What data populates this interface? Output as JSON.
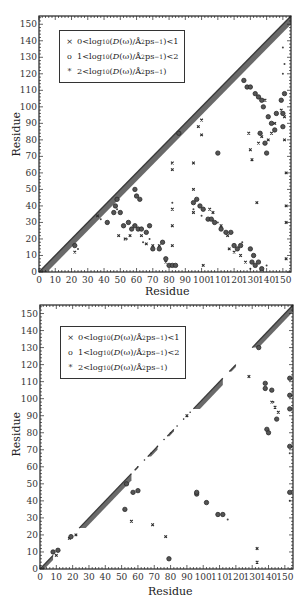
{
  "chart_data": [
    {
      "type": "scatter",
      "panel": "top",
      "title": "",
      "xlabel": "Residue",
      "ylabel": "Residue",
      "xlim": [
        0,
        155
      ],
      "ylim": [
        0,
        155
      ],
      "x_ticks": [
        0,
        10,
        20,
        30,
        40,
        50,
        60,
        70,
        80,
        90,
        100,
        110,
        120,
        130,
        140,
        150
      ],
      "y_ticks": [
        0,
        10,
        20,
        30,
        40,
        50,
        60,
        70,
        80,
        90,
        100,
        110,
        120,
        130,
        140,
        150
      ],
      "grid": false,
      "legend_position": "upper-left inside",
      "legend": [
        {
          "symbol": "x-small",
          "label": "0 < log10 (D(ω)/Å²ps⁻¹) < 1"
        },
        {
          "symbol": "circle",
          "label": "1 < log10 (D(ω)/Å²ps⁻¹) < 2"
        },
        {
          "symbol": "asterisk",
          "label": "2 < log10 (D(ω)/Å²ps⁻¹)"
        }
      ],
      "diagonal_band": {
        "from": 0,
        "to": 155,
        "width_residues": 5,
        "description": "dense band along the diagonal i≈j (all classes)"
      },
      "series": [
        {
          "name": "0 < log10 D < 1",
          "marker": "x",
          "points": [
            [
              22,
              12
            ],
            [
              36,
              34
            ],
            [
              49,
              22
            ],
            [
              53,
              20
            ],
            [
              56,
              22
            ],
            [
              63,
              22
            ],
            [
              66,
              17
            ],
            [
              70,
              16
            ],
            [
              74,
              16
            ],
            [
              78,
              6
            ],
            [
              82,
              62
            ],
            [
              82,
              66
            ],
            [
              82,
              38
            ],
            [
              82,
              28
            ],
            [
              82,
              16
            ],
            [
              95,
              66
            ],
            [
              95,
              50
            ],
            [
              95,
              42
            ],
            [
              95,
              36
            ],
            [
              98,
              88
            ],
            [
              100,
              92
            ],
            [
              100,
              83
            ],
            [
              101,
              4
            ],
            [
              105,
              38
            ],
            [
              107,
              36
            ],
            [
              112,
              28
            ],
            [
              116,
              22
            ],
            [
              117,
              14
            ],
            [
              120,
              12
            ],
            [
              124,
              10
            ],
            [
              127,
              6
            ],
            [
              129,
              84
            ],
            [
              130,
              74
            ],
            [
              131,
              68
            ],
            [
              134,
              42
            ],
            [
              135,
              78
            ],
            [
              137,
              82
            ],
            [
              139,
              104
            ],
            [
              141,
              80
            ],
            [
              143,
              84
            ],
            [
              145,
              90
            ],
            [
              149,
              98
            ],
            [
              151,
              94
            ],
            [
              151,
              80
            ],
            [
              152,
              60
            ],
            [
              152,
              40
            ],
            [
              152,
              30
            ],
            [
              152,
              8
            ]
          ]
        },
        {
          "name": "1 < log10 D < 2",
          "marker": "circle",
          "points": [
            [
              22,
              16
            ],
            [
              42,
              30
            ],
            [
              46,
              36
            ],
            [
              47,
              40
            ],
            [
              48,
              44
            ],
            [
              50,
              36
            ],
            [
              52,
              28
            ],
            [
              55,
              30
            ],
            [
              57,
              26
            ],
            [
              59,
              28
            ],
            [
              61,
              26
            ],
            [
              62,
              44
            ],
            [
              59,
              50
            ],
            [
              60,
              46
            ],
            [
              63,
              26
            ],
            [
              66,
              24
            ],
            [
              68,
              28
            ],
            [
              70,
              14
            ],
            [
              74,
              14
            ],
            [
              76,
              18
            ],
            [
              78,
              8
            ],
            [
              80,
              4
            ],
            [
              82,
              4
            ],
            [
              84,
              4
            ],
            [
              86,
              84
            ],
            [
              95,
              42
            ],
            [
              97,
              44
            ],
            [
              99,
              40
            ],
            [
              101,
              38
            ],
            [
              104,
              32
            ],
            [
              106,
              32
            ],
            [
              108,
              30
            ],
            [
              110,
              72
            ],
            [
              112,
              26
            ],
            [
              115,
              24
            ],
            [
              118,
              24
            ],
            [
              120,
              16
            ],
            [
              122,
              14
            ],
            [
              124,
              16
            ],
            [
              126,
              116
            ],
            [
              128,
              112
            ],
            [
              130,
              112
            ],
            [
              130,
              14
            ],
            [
              132,
              10
            ],
            [
              133,
              108
            ],
            [
              135,
              106
            ],
            [
              136,
              84
            ],
            [
              137,
              104
            ],
            [
              138,
              100
            ],
            [
              139,
              78
            ],
            [
              140,
              72
            ],
            [
              141,
              94
            ],
            [
              143,
              90
            ],
            [
              145,
              86
            ],
            [
              146,
              96
            ],
            [
              149,
              104
            ],
            [
              150,
              96
            ],
            [
              150,
              88
            ],
            [
              151,
              108
            ],
            [
              131,
              6
            ],
            [
              133,
              4
            ],
            [
              135,
              6
            ],
            [
              137,
              2
            ]
          ]
        },
        {
          "name": "2 < log10 D",
          "marker": "asterisk",
          "points": [
            [
              24,
              14
            ],
            [
              38,
              32
            ],
            [
              48,
              38
            ],
            [
              54,
              20
            ],
            [
              58,
              28
            ],
            [
              64,
              18
            ],
            [
              68,
              20
            ],
            [
              82,
              42
            ],
            [
              95,
              38
            ],
            [
              100,
              34
            ],
            [
              110,
              30
            ],
            [
              125,
              18
            ],
            [
              130,
              2
            ],
            [
              140,
              4
            ],
            [
              150,
              120
            ],
            [
              150,
              136
            ],
            [
              151,
              126
            ]
          ]
        }
      ]
    },
    {
      "type": "scatter",
      "panel": "bottom",
      "title": "",
      "xlabel": "Residue",
      "ylabel": "Residue",
      "xlim": [
        0,
        155
      ],
      "ylim": [
        0,
        155
      ],
      "x_ticks": [
        0,
        10,
        20,
        30,
        40,
        50,
        60,
        70,
        80,
        90,
        100,
        110,
        120,
        130,
        140,
        150
      ],
      "y_ticks": [
        0,
        10,
        20,
        30,
        40,
        50,
        60,
        70,
        80,
        90,
        100,
        110,
        120,
        130,
        140,
        150
      ],
      "grid": false,
      "legend_position": "upper-left inside",
      "legend": [
        {
          "symbol": "x-small",
          "label": "0 < log10 (D(ω)/Å²ps⁻¹) < 1"
        },
        {
          "symbol": "circle",
          "label": "1 < log10 (D(ω)/Å²ps⁻¹) < 2"
        },
        {
          "symbol": "asterisk",
          "label": "2 < log10 (D(ω)/Å²ps⁻¹)"
        }
      ],
      "diagonal_segments": [
        [
          0,
          8
        ],
        [
          24,
          56
        ],
        [
          58,
          60
        ],
        [
          66,
          72
        ],
        [
          78,
          82
        ],
        [
          94,
          112
        ],
        [
          116,
          120
        ],
        [
          130,
          155
        ]
      ],
      "series": [
        {
          "name": "0 < log10 D < 1",
          "marker": "x",
          "points": [
            [
              10,
              8
            ],
            [
              18,
              18
            ],
            [
              22,
              20
            ],
            [
              56,
              28
            ],
            [
              69,
              26
            ],
            [
              77,
              19
            ],
            [
              90,
              90
            ],
            [
              128,
              113
            ],
            [
              133,
              12
            ],
            [
              133,
              4
            ],
            [
              142,
              98
            ],
            [
              144,
              95
            ],
            [
              146,
              92
            ]
          ]
        },
        {
          "name": "1 < log10 D < 2",
          "marker": "circle",
          "points": [
            [
              8,
              10
            ],
            [
              11,
              11
            ],
            [
              19,
              19
            ],
            [
              52,
              35
            ],
            [
              53,
              50
            ],
            [
              57,
              45
            ],
            [
              60,
              46
            ],
            [
              96,
              44
            ],
            [
              96,
              45
            ],
            [
              102,
              39
            ],
            [
              109,
              32
            ],
            [
              112,
              32
            ],
            [
              134,
              130
            ],
            [
              138,
              109
            ],
            [
              138,
              106
            ],
            [
              139,
              82
            ],
            [
              140,
              80
            ],
            [
              142,
              105
            ],
            [
              145,
              88
            ],
            [
              153,
              112
            ],
            [
              153,
              102
            ],
            [
              153,
              94
            ],
            [
              153,
              72
            ],
            [
              153,
              45
            ],
            [
              79,
              6
            ]
          ]
        },
        {
          "name": "2 < log10 D",
          "marker": "asterisk",
          "points": [
            [
              115,
              29
            ],
            [
              143,
              98
            ],
            [
              153,
              40
            ],
            [
              153,
              68
            ]
          ]
        }
      ]
    }
  ],
  "panels": {
    "top": {
      "xlabel": "Residue",
      "ylabel": "Residue"
    },
    "bottom": {
      "xlabel": "Residue",
      "ylabel": "Residue"
    }
  },
  "legend": {
    "row1": {
      "lo": "0",
      "hi": "1"
    },
    "row2": {
      "lo": "1",
      "hi": "2"
    },
    "row3": {
      "lo": "2"
    },
    "log_text": "log",
    "log_sub": "10",
    "expr_open": " (",
    "D": "D",
    "omega": "(ω)",
    "unit": "/Å",
    "sup2": "2",
    "ps": "ps",
    "supm1": "−1",
    "expr_close": ")",
    "lt": " < ",
    "sym_x": "×",
    "sym_circle": "o",
    "sym_star": "*"
  },
  "style": {
    "point_color": "#2a2a2a",
    "band_color": "#6a6a6a",
    "axis_color": "#222222"
  }
}
